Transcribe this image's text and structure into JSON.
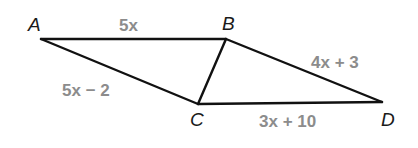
{
  "diagram": {
    "vertices": {
      "A": {
        "label": "A",
        "x": 41,
        "y": 39
      },
      "B": {
        "label": "B",
        "x": 226,
        "y": 39
      },
      "C": {
        "label": "C",
        "x": 198,
        "y": 104
      },
      "D": {
        "label": "D",
        "x": 382,
        "y": 102
      }
    },
    "segments": [
      {
        "from": "A",
        "to": "B",
        "label": "5x"
      },
      {
        "from": "A",
        "to": "C",
        "label": "5x − 2"
      },
      {
        "from": "B",
        "to": "C",
        "label": ""
      },
      {
        "from": "B",
        "to": "D",
        "label": "4x + 3"
      },
      {
        "from": "C",
        "to": "D",
        "label": "3x + 10"
      }
    ],
    "colors": {
      "line": "#111111",
      "vertex_label": "#1a1a1a",
      "side_label": "#8c8c8c"
    }
  }
}
